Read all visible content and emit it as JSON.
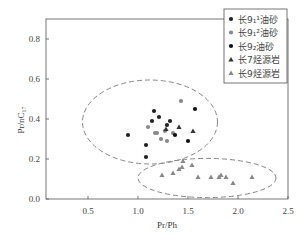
{
  "chart_data": {
    "type": "scatter",
    "title": "",
    "xlabel": "Pr/Ph",
    "ylabel": "Pr/nC17",
    "ylabel_main": "Pr/nC",
    "ylabel_sub": "17",
    "xlim": [
      0.08,
      2.5
    ],
    "ylim": [
      0.0,
      0.9
    ],
    "xticks": [
      0.5,
      1.0,
      1.5,
      2.0,
      2.5
    ],
    "xtick_labels": [
      "0.5",
      "1.0",
      "1.5",
      "2.0",
      "2.5"
    ],
    "yticks": [
      0.0,
      0.2,
      0.4,
      0.6,
      0.8
    ],
    "ytick_labels": [
      "0.0",
      "0.2",
      "0.4",
      "0.6",
      "0.8"
    ],
    "grid": false,
    "legend_position": "upper right",
    "series": [
      {
        "name": "长9₁¹油砂",
        "marker": "circle",
        "color": "#222222",
        "points": [
          [
            1.16,
            0.44
          ],
          [
            1.21,
            0.41
          ],
          [
            1.14,
            0.39
          ],
          [
            1.32,
            0.39
          ],
          [
            1.29,
            0.37
          ],
          [
            0.9,
            0.32
          ],
          [
            1.08,
            0.27
          ],
          [
            1.08,
            0.21
          ]
        ]
      },
      {
        "name": "长9₁²油砂",
        "marker": "circle",
        "color": "#888888",
        "points": [
          [
            1.43,
            0.49
          ],
          [
            1.1,
            0.36
          ],
          [
            1.27,
            0.34
          ],
          [
            1.17,
            0.33
          ],
          [
            1.19,
            0.33
          ],
          [
            1.35,
            0.33
          ],
          [
            1.23,
            0.3
          ],
          [
            1.29,
            0.29
          ]
        ]
      },
      {
        "name": "长9₂油砂",
        "marker": "circle",
        "color": "#111111",
        "points": [
          [
            1.57,
            0.45
          ],
          [
            1.37,
            0.32
          ],
          [
            1.5,
            0.29
          ]
        ]
      },
      {
        "name": "长7烃源岩",
        "marker": "triangle",
        "color": "#333333",
        "points": [
          [
            1.41,
            0.36
          ],
          [
            1.55,
            0.34
          ],
          [
            1.28,
            0.35
          ]
        ]
      },
      {
        "name": "长9烃源岩",
        "marker": "triangle",
        "color": "#888888",
        "points": [
          [
            1.24,
            0.12
          ],
          [
            1.35,
            0.13
          ],
          [
            1.41,
            0.15
          ],
          [
            1.44,
            0.16
          ],
          [
            1.45,
            0.19
          ],
          [
            1.54,
            0.17
          ],
          [
            1.6,
            0.11
          ],
          [
            1.73,
            0.11
          ],
          [
            1.81,
            0.11
          ],
          [
            1.83,
            0.12
          ],
          [
            1.88,
            0.11
          ],
          [
            1.95,
            0.08
          ],
          [
            2.14,
            0.11
          ]
        ]
      }
    ],
    "annotations": [
      {
        "type": "dashed-ellipse",
        "cx": 1.12,
        "cy": 0.385,
        "rx": 0.675,
        "ry": 0.21
      },
      {
        "type": "dashed-ellipse",
        "cx": 1.69,
        "cy": 0.105,
        "rx": 0.69,
        "ry": 0.098
      }
    ]
  }
}
